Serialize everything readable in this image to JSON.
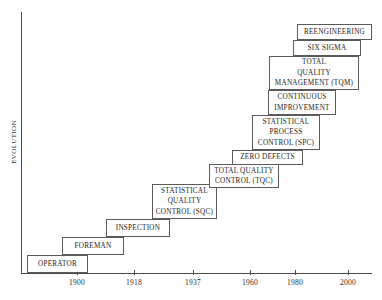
{
  "chart_data": {
    "type": "bar",
    "title": "",
    "xlabel": "",
    "ylabel": "EVOLUTION",
    "xticklabels": [
      "1900",
      "1918",
      "1937",
      "1960",
      "1980",
      "2000"
    ],
    "grid": false,
    "legend": null,
    "categories": [
      "OPERATOR",
      "FOREMAN",
      "INSPECTION",
      "STATISTICAL QUALITY CONTROL (SQC)",
      "TOTAL QUALITY CONTROL (TQC)",
      "ZERO DEFECTS",
      "STATISTICAL PROCESS CONTROL (SPC)",
      "CONTINUOUS IMPROVEMENT",
      "TOTAL QUALITY MANAGEMENT (TQM)",
      "SIX SIGMA",
      "REENGINEERING"
    ],
    "values": [
      1,
      2,
      3,
      4,
      5,
      6,
      7,
      8,
      9,
      10,
      11
    ],
    "note": "Ascending staircase of quality-management eras plotted against time"
  },
  "axes": {
    "y_label": "EVOLUTION",
    "x_ticks": [
      {
        "label": "1900",
        "x": 77
      },
      {
        "label": "1918",
        "x": 134
      },
      {
        "label": "1937",
        "x": 193
      },
      {
        "label": "1960",
        "x": 250
      },
      {
        "label": "1980",
        "x": 295
      },
      {
        "label": "2000",
        "x": 348
      }
    ]
  },
  "steps": [
    {
      "name": "operator",
      "lines": [
        "OPERATOR"
      ],
      "left": 27,
      "top": 255,
      "width": 61,
      "height": 18
    },
    {
      "name": "foreman",
      "lines": [
        "FOREMAN"
      ],
      "left": 62,
      "top": 237,
      "width": 62,
      "height": 18
    },
    {
      "name": "inspection",
      "lines": [
        "INSPECTION"
      ],
      "left": 106,
      "top": 219,
      "width": 64,
      "height": 18
    },
    {
      "name": "statistical-quality-control-sqc",
      "lines": [
        "STATISTICAL",
        "QUALITY",
        "CONTROL (SQC)"
      ],
      "left": 152,
      "top": 184,
      "width": 65,
      "height": 35
    },
    {
      "name": "total-quality-control-tqc",
      "lines": [
        "TOTAL QUALITY",
        "CONTROL  (TQC)"
      ],
      "left": 209,
      "top": 164,
      "width": 70,
      "height": 24
    },
    {
      "name": "zero-defects",
      "lines": [
        "ZERO DEFECTS"
      ],
      "left": 232,
      "top": 150,
      "width": 71,
      "height": 15
    },
    {
      "name": "statistical-process-control-spc",
      "lines": [
        "STATISTICAL",
        "PROCESS",
        "CONTROL (SPC)"
      ],
      "left": 252,
      "top": 115,
      "width": 68,
      "height": 35
    },
    {
      "name": "continuous-improvement",
      "lines": [
        "CONTINUOUS",
        "IMPROVEMENT"
      ],
      "left": 268,
      "top": 90,
      "width": 68,
      "height": 25
    },
    {
      "name": "total-quality-management-tqm",
      "lines": [
        "TOTAL",
        "QUALITY",
        "MANAGEMENT (TQM)"
      ],
      "left": 269,
      "top": 56,
      "width": 90,
      "height": 34
    },
    {
      "name": "six-sigma",
      "lines": [
        "SIX SIGMA"
      ],
      "left": 293,
      "top": 40,
      "width": 68,
      "height": 16
    },
    {
      "name": "reengineering",
      "lines": [
        "REENGINEERING"
      ],
      "left": 297,
      "top": 24,
      "width": 75,
      "height": 16
    }
  ]
}
